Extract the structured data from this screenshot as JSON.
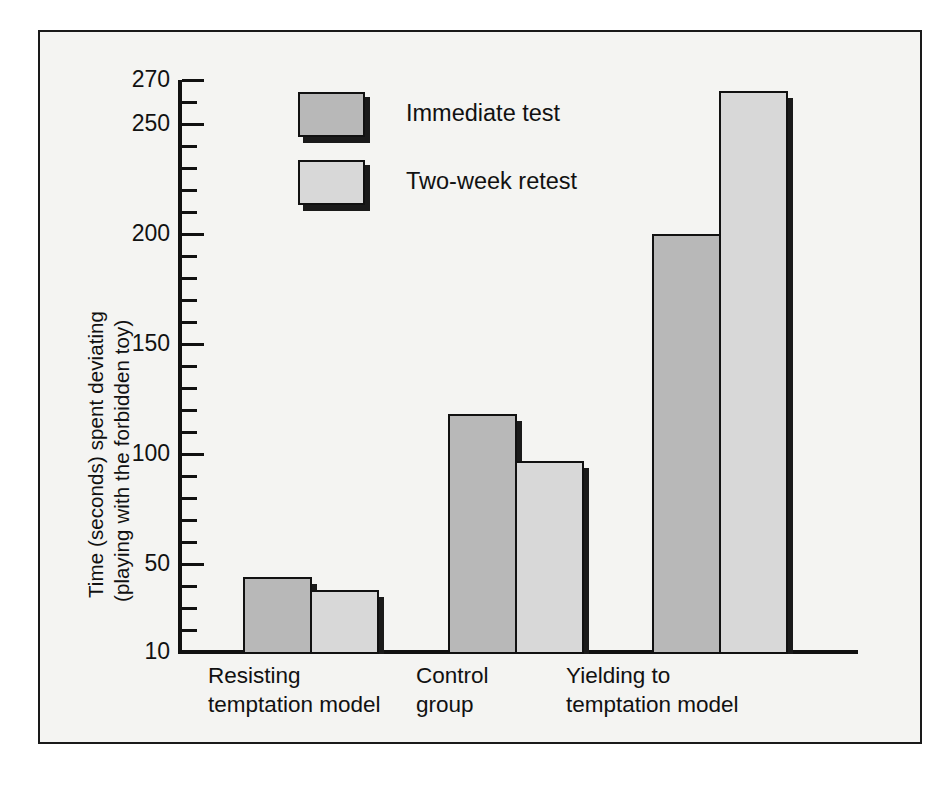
{
  "chart_data": {
    "type": "bar",
    "title": "",
    "xlabel": "",
    "ylabel": "Time (seconds) spent deviating (playing with the forbidden toy)",
    "ylabel_lines": [
      "Time (seconds) spent deviating",
      "(playing with the forbidden toy)"
    ],
    "categories": [
      "Resisting temptation model",
      "Control group",
      "Yielding to temptation model"
    ],
    "category_lines": [
      [
        "Resisting",
        "temptation model"
      ],
      [
        "Control",
        "group"
      ],
      [
        "Yielding to",
        "temptation model"
      ]
    ],
    "series": [
      {
        "name": "Immediate test",
        "values": [
          44,
          118,
          200
        ],
        "color": "#b8b8b8"
      },
      {
        "name": "Two-week retest",
        "values": [
          38,
          97,
          265
        ],
        "color": "#d8d8d8"
      }
    ],
    "ylim": [
      10,
      270
    ],
    "yticks_major": [
      10,
      50,
      100,
      150,
      200,
      250,
      270
    ],
    "yticks_major_labels": [
      "10",
      "50",
      "100",
      "150",
      "200",
      "250",
      "270"
    ],
    "ytick_minor_step": 10,
    "grid": false,
    "legend_position": "top-center-left",
    "legend_entries": [
      "Immediate test",
      "Two-week retest"
    ],
    "frame": true,
    "shadow_style": "offset-drop-shadow"
  },
  "axis": {
    "tick_labels": [
      "270",
      "250",
      "200",
      "150",
      "100",
      "50",
      "10"
    ]
  },
  "legend": {
    "items": [
      {
        "label": "Immediate test",
        "swatch": "legend-swatch-immediate"
      },
      {
        "label": "Two-week retest",
        "swatch": "legend-swatch-retest"
      }
    ]
  },
  "xaxis": {
    "groups": [
      {
        "line1": "Resisting",
        "line2": "temptation model"
      },
      {
        "line1": "Control",
        "line2": "group"
      },
      {
        "line1": "Yielding to",
        "line2": "temptation model"
      }
    ]
  },
  "ylabel": {
    "line1": "Time (seconds) spent deviating",
    "line2": "(playing with the forbidden toy)"
  },
  "colors": {
    "immediate": "#b8b8b8",
    "retest": "#d8d8d8",
    "ink": "#111111",
    "paper": "#f4f4f2"
  }
}
